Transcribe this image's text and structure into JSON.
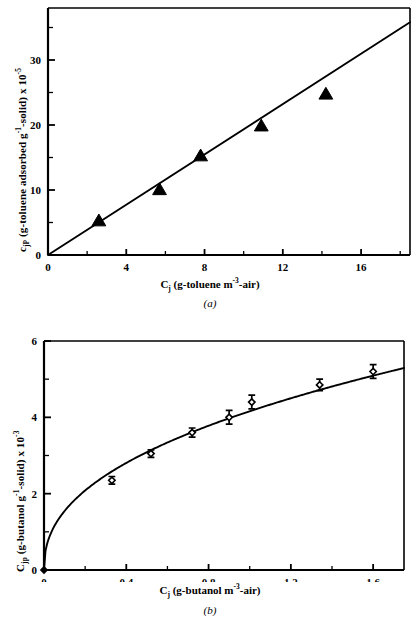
{
  "figure": {
    "panels": [
      {
        "caption": "(a)",
        "xlabel_parts": {
          "sym": "C",
          "sub": "j",
          "rest_a": " (g-toluene m",
          "sup": "-3",
          "rest_b": "-air)"
        },
        "ylabel_parts": {
          "sym": "c",
          "sub": "jP",
          "rest_a": " (g-toluene adsorbed g",
          "sup1": "-1",
          "rest_b": "-solid) x 10",
          "sup2": "-5"
        },
        "xticks": [
          "0",
          "4",
          "8",
          "12",
          "16"
        ],
        "yticks": [
          "0",
          "10",
          "20",
          "30"
        ]
      },
      {
        "caption": "(b)",
        "xlabel_parts": {
          "sym": "C",
          "sub": "j",
          "rest_a": " (g-butanol m",
          "sup": "-3",
          "rest_b": "-air)"
        },
        "ylabel_parts": {
          "sym": "C",
          "sub": "jp",
          "rest_a": " (g-butanol g",
          "sup1": "-1",
          "rest_b": "-solid) x 10",
          "sup2": "-3"
        },
        "xticks": [
          "0",
          "0.4",
          "0.8",
          "1.2",
          "1.6"
        ],
        "yticks": [
          "0",
          "2",
          "4",
          "6"
        ]
      }
    ]
  },
  "chart_data": [
    {
      "type": "scatter",
      "panel": "(a)",
      "title": "",
      "xlabel": "Cj (g-toluene m-3-air)",
      "ylabel": "cjP (g-toluene adsorbed g-1-solid) x 10-5",
      "xlim": [
        0,
        18.5
      ],
      "ylim": [
        0,
        38
      ],
      "xticks": [
        0,
        4,
        8,
        12,
        16
      ],
      "yticks": [
        0,
        10,
        20,
        30
      ],
      "minor_ticks": true,
      "grid": false,
      "legend": null,
      "marker": "filled-triangle",
      "series": [
        {
          "name": "toluene adsorption data",
          "x": [
            2.6,
            5.7,
            7.8,
            10.9,
            14.2
          ],
          "y": [
            5.2,
            10.0,
            15.2,
            19.8,
            24.7
          ]
        }
      ],
      "fit_line": {
        "name": "linear fit",
        "x": [
          0,
          18.5
        ],
        "y": [
          0,
          35.8
        ],
        "slope": 1.935,
        "intercept": 0
      }
    },
    {
      "type": "scatter",
      "panel": "(b)",
      "title": "",
      "xlabel": "Cj (g-butanol m-3-air)",
      "ylabel": "Cjp (g-butanol g-1-solid) x 10-3",
      "xlim": [
        0,
        1.75
      ],
      "ylim": [
        0,
        6
      ],
      "xticks": [
        0,
        0.4,
        0.8,
        1.2,
        1.6
      ],
      "yticks": [
        0,
        2,
        4,
        6
      ],
      "minor_ticks": true,
      "grid": false,
      "legend": null,
      "marker": "open-diamond",
      "series": [
        {
          "name": "butanol adsorption data",
          "x": [
            0.0,
            0.33,
            0.52,
            0.72,
            0.9,
            1.01,
            1.34,
            1.6
          ],
          "y": [
            0.0,
            2.35,
            3.05,
            3.6,
            4.0,
            4.4,
            4.85,
            5.2
          ],
          "yerr": [
            0.0,
            0.1,
            0.1,
            0.12,
            0.18,
            0.18,
            0.15,
            0.18
          ]
        }
      ],
      "fit_line": {
        "name": "freundlich fit",
        "form": "y = 4.16 * x^0.43",
        "coefficient": 4.16,
        "exponent": 0.43
      }
    }
  ]
}
